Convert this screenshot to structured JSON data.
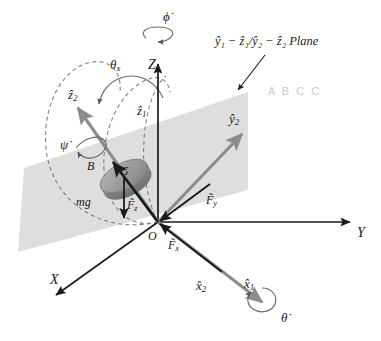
{
  "figure": {
    "background_color": "#ffffff",
    "plane_fill": "#d9d9d9",
    "axis_color": "#1a1a1a",
    "body_axis_color": "#8c8c8c",
    "dashed_color": "#7a7a7a",
    "disk_color": "#9b9b9b",
    "watermark_color": "#c9c9c9"
  },
  "labels": {
    "phi_dot": "ϕ̇",
    "theta_dot": "θ̇",
    "psi_dot": "ψ̇",
    "theta_x": "θ",
    "theta_x_sub": "x",
    "Z": "Z",
    "Y": "Y",
    "X": "X",
    "O": "O",
    "G": "G",
    "B": "B",
    "mg": "mg",
    "z_hat_1": "ẑ",
    "z_hat_1_sub": "1",
    "z_hat_2": "ẑ",
    "z_hat_2_sub": "2",
    "y_hat_2": "ŷ",
    "y_hat_2_sub": "2",
    "x_hat_1": "x̂",
    "x_hat_1_sub": "1",
    "x_hat_2": "x̂",
    "x_hat_2_sub": "2",
    "F_x": "F̃",
    "F_x_sub": "x",
    "F_y": "F̃",
    "F_y_sub": "y",
    "F_z": "F̃",
    "F_z_sub": "z",
    "plane_annotation": "ŷ₁ − ẑ₁/ŷ₂ − ẑ₂ Plane",
    "watermark": "A B C C"
  },
  "geometry": {
    "origin": {
      "x": 158,
      "y": 222
    },
    "disk_center_G": {
      "x": 124,
      "y": 176
    },
    "axes": [
      {
        "name": "Z",
        "from": [
          158,
          222
        ],
        "to": [
          158,
          62
        ],
        "color": "#1a1a1a",
        "style": "solid"
      },
      {
        "name": "Y",
        "from": [
          158,
          222
        ],
        "to": [
          352,
          222
        ],
        "color": "#1a1a1a",
        "style": "solid"
      },
      {
        "name": "X",
        "from": [
          158,
          222
        ],
        "to": [
          54,
          297
        ],
        "color": "#1a1a1a",
        "style": "solid"
      }
    ],
    "body_axes": [
      {
        "name": "z_hat_2",
        "from": [
          158,
          222
        ],
        "to": [
          75,
          104
        ],
        "color": "#8c8c8c"
      },
      {
        "name": "y_hat_2",
        "from": [
          158,
          222
        ],
        "to": [
          245,
          131
        ],
        "color": "#8c8c8c"
      },
      {
        "name": "x_hat_2_x_hat_1",
        "from": [
          158,
          222
        ],
        "to": [
          265,
          305
        ],
        "color": "#8c8c8c"
      }
    ],
    "forces": [
      {
        "name": "F_x",
        "from": [
          158,
          222
        ],
        "to": [
          222,
          272
        ],
        "color": "#1a1a1a"
      },
      {
        "name": "F_y",
        "from": [
          158,
          222
        ],
        "to": [
          212,
          182
        ],
        "color": "#1a1a1a"
      },
      {
        "name": "F_z",
        "from": [
          158,
          222
        ],
        "to": [
          111,
          159
        ],
        "color": "#1a1a1a"
      },
      {
        "name": "mg",
        "from": [
          124,
          176
        ],
        "to": [
          124,
          221
        ],
        "color": "#1a1a1a"
      }
    ],
    "plane_polygon": [
      [
        24,
        168
      ],
      [
        248,
        92
      ],
      [
        248,
        190
      ],
      [
        18,
        252
      ]
    ],
    "disk": {
      "cx": 124,
      "cy": 176,
      "rx": 26,
      "ry": 13,
      "rotation": -28,
      "thickness": 9
    }
  }
}
